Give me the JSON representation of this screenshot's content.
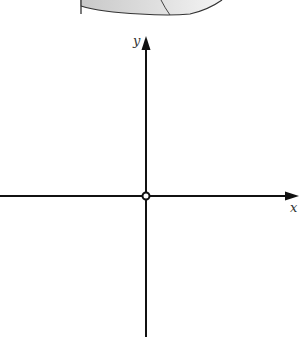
{
  "figure": {
    "type": "coordinate-axes",
    "axes": {
      "x_label": "x",
      "y_label": "y"
    },
    "origin_marker": "open-circle",
    "top_shape": "partial-shaded-surface"
  },
  "colors": {
    "axis": "#111111",
    "shape_fill": "#d8d8d8",
    "shape_stroke": "#333333",
    "background": "#ffffff"
  }
}
